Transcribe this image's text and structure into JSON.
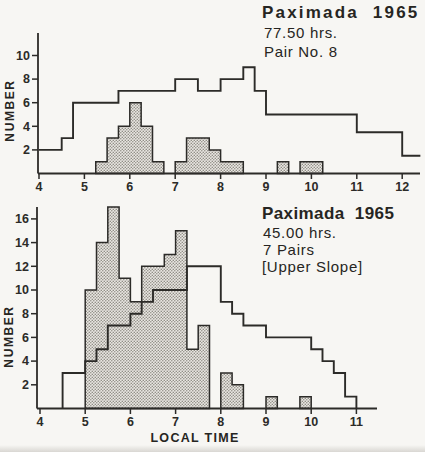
{
  "colors": {
    "paper": "#f7f6f3",
    "ink": "#2c2b28",
    "hatch_background": "#e9e7e2",
    "hatch_dot": "#8f8c85"
  },
  "chart_data": [
    {
      "type": "step-histogram",
      "title": "Paximada  1965",
      "annotations": [
        "77.50 hrs.",
        "Pair No. 8"
      ],
      "ylabel": "NUMBER",
      "xlabel": "",
      "x_ticks": [
        4,
        5,
        6,
        7,
        8,
        9,
        10,
        11,
        12
      ],
      "y_ticks": [
        2,
        4,
        6,
        8,
        10
      ],
      "xlim": [
        4,
        12.4
      ],
      "ylim": [
        0,
        12
      ],
      "grid": false,
      "legend": "none",
      "series": [
        {
          "name": "open-outline-histogram",
          "style": "open-step-outline",
          "starts_at_baseline": false,
          "ends_at_baseline": false,
          "levels": [
            {
              "from": 4.0,
              "to": 4.5,
              "value": 2
            },
            {
              "from": 4.5,
              "to": 4.75,
              "value": 3
            },
            {
              "from": 4.75,
              "to": 5.75,
              "value": 6
            },
            {
              "from": 5.75,
              "to": 7.0,
              "value": 7
            },
            {
              "from": 7.0,
              "to": 7.5,
              "value": 8
            },
            {
              "from": 7.5,
              "to": 8.0,
              "value": 7
            },
            {
              "from": 8.0,
              "to": 8.5,
              "value": 8
            },
            {
              "from": 8.5,
              "to": 8.75,
              "value": 9
            },
            {
              "from": 8.75,
              "to": 9.0,
              "value": 7
            },
            {
              "from": 9.0,
              "to": 11.0,
              "value": 5
            },
            {
              "from": 11.0,
              "to": 12.0,
              "value": 3.5
            },
            {
              "from": 12.0,
              "to": 12.4,
              "value": 1.5
            }
          ]
        },
        {
          "name": "hatched-histogram",
          "style": "hatched-bars",
          "bars": [
            {
              "from": 5.25,
              "to": 5.5,
              "value": 1
            },
            {
              "from": 5.5,
              "to": 5.75,
              "value": 3
            },
            {
              "from": 5.75,
              "to": 6.0,
              "value": 4
            },
            {
              "from": 6.0,
              "to": 6.25,
              "value": 6
            },
            {
              "from": 6.25,
              "to": 6.5,
              "value": 4
            },
            {
              "from": 6.5,
              "to": 6.75,
              "value": 1
            },
            {
              "from": 7.0,
              "to": 7.25,
              "value": 1
            },
            {
              "from": 7.25,
              "to": 7.75,
              "value": 3
            },
            {
              "from": 7.75,
              "to": 8.0,
              "value": 2
            },
            {
              "from": 8.0,
              "to": 8.5,
              "value": 1
            },
            {
              "from": 9.25,
              "to": 9.5,
              "value": 1
            },
            {
              "from": 9.75,
              "to": 10.25,
              "value": 1
            }
          ]
        }
      ]
    },
    {
      "type": "step-histogram",
      "title": "Paximada  1965",
      "annotations": [
        "45.00 hrs.",
        "7 Pairs",
        "[Upper Slope]"
      ],
      "ylabel": "NUMBER",
      "xlabel": "LOCAL TIME",
      "x_ticks": [
        4,
        5,
        6,
        7,
        8,
        9,
        10,
        11
      ],
      "y_ticks": [
        2,
        4,
        6,
        8,
        10,
        12,
        14,
        16
      ],
      "xlim": [
        4,
        11.45
      ],
      "ylim": [
        0,
        17
      ],
      "grid": false,
      "legend": "none",
      "series": [
        {
          "name": "open-outline-histogram",
          "style": "open-step-outline",
          "starts_at_baseline": true,
          "ends_at_baseline": true,
          "levels": [
            {
              "from": 4.5,
              "to": 5.0,
              "value": 3
            },
            {
              "from": 5.0,
              "to": 5.25,
              "value": 4
            },
            {
              "from": 5.25,
              "to": 5.5,
              "value": 5
            },
            {
              "from": 5.5,
              "to": 6.0,
              "value": 7
            },
            {
              "from": 6.0,
              "to": 6.25,
              "value": 8
            },
            {
              "from": 6.25,
              "to": 6.5,
              "value": 9
            },
            {
              "from": 6.5,
              "to": 7.25,
              "value": 10
            },
            {
              "from": 7.25,
              "to": 8.0,
              "value": 12
            },
            {
              "from": 8.0,
              "to": 8.25,
              "value": 9
            },
            {
              "from": 8.25,
              "to": 8.5,
              "value": 8
            },
            {
              "from": 8.5,
              "to": 9.0,
              "value": 7
            },
            {
              "from": 9.0,
              "to": 10.0,
              "value": 6
            },
            {
              "from": 10.0,
              "to": 10.25,
              "value": 5
            },
            {
              "from": 10.25,
              "to": 10.5,
              "value": 4
            },
            {
              "from": 10.5,
              "to": 10.75,
              "value": 3
            },
            {
              "from": 10.75,
              "to": 11.0,
              "value": 1
            }
          ]
        },
        {
          "name": "hatched-histogram",
          "style": "hatched-bars",
          "bars": [
            {
              "from": 5.0,
              "to": 5.25,
              "value": 10
            },
            {
              "from": 5.25,
              "to": 5.5,
              "value": 14
            },
            {
              "from": 5.5,
              "to": 5.75,
              "value": 17
            },
            {
              "from": 5.75,
              "to": 6.0,
              "value": 11
            },
            {
              "from": 6.0,
              "to": 6.25,
              "value": 9
            },
            {
              "from": 6.25,
              "to": 6.75,
              "value": 12
            },
            {
              "from": 6.75,
              "to": 7.0,
              "value": 13
            },
            {
              "from": 7.0,
              "to": 7.25,
              "value": 15
            },
            {
              "from": 7.25,
              "to": 7.5,
              "value": 5
            },
            {
              "from": 7.5,
              "to": 7.75,
              "value": 7
            },
            {
              "from": 8.0,
              "to": 8.25,
              "value": 3
            },
            {
              "from": 8.25,
              "to": 8.5,
              "value": 2
            },
            {
              "from": 9.0,
              "to": 9.25,
              "value": 1
            },
            {
              "from": 9.75,
              "to": 10.0,
              "value": 1
            }
          ]
        }
      ]
    }
  ]
}
